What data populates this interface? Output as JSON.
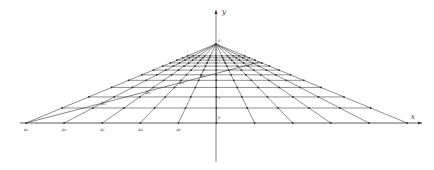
{
  "figure": {
    "type": "perspective-grid",
    "axes": {
      "x_label": "x",
      "y_label": "y",
      "origin_label": "0",
      "vanishing_point_label": "0"
    },
    "baseline_point_labels": [
      "a₁",
      "a₂",
      "a₃",
      "a₄",
      "a₅"
    ],
    "diagonal_point_labels": [
      "b₁",
      "b₂",
      "b₃",
      "b₄"
    ],
    "axis_tick_label": "1",
    "colors": {
      "line": "#333333",
      "background": "#ffffff"
    }
  }
}
